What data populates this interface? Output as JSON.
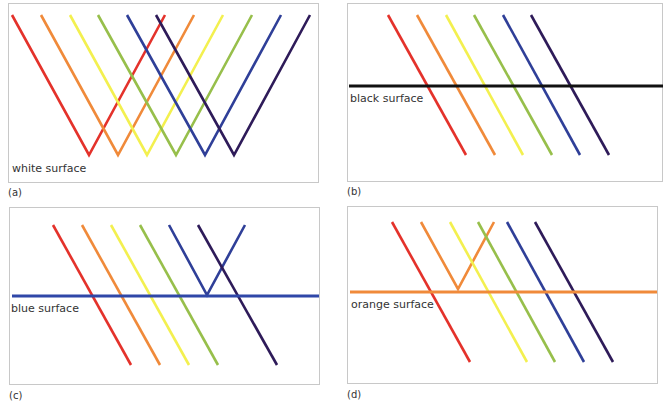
{
  "figure": {
    "colors": {
      "red": "#e4322b",
      "orange": "#f08a3a",
      "yellow": "#f3f04f",
      "green": "#97bf4b",
      "blue": "#2f3f98",
      "violet": "#2e1b59",
      "frame": "#c8c8c8",
      "black": "#111111"
    },
    "panels": [
      {
        "id": "a",
        "label": "(a)",
        "surface_label": "white surface",
        "surface_color": "none",
        "description": "All six coloured rays are reflected"
      },
      {
        "id": "b",
        "label": "(b)",
        "surface_label": "black surface",
        "surface_color": "#111111",
        "description": "All six coloured rays are absorbed"
      },
      {
        "id": "c",
        "label": "(c)",
        "surface_label": "blue surface",
        "surface_color": "#2f47a8",
        "description": "Only the blue ray is reflected"
      },
      {
        "id": "d",
        "label": "(d)",
        "surface_label": "orange surface",
        "surface_color": "#f08a3a",
        "description": "Only the orange ray is reflected"
      }
    ],
    "rays": [
      "red",
      "orange",
      "yellow",
      "green",
      "blue",
      "violet"
    ]
  }
}
